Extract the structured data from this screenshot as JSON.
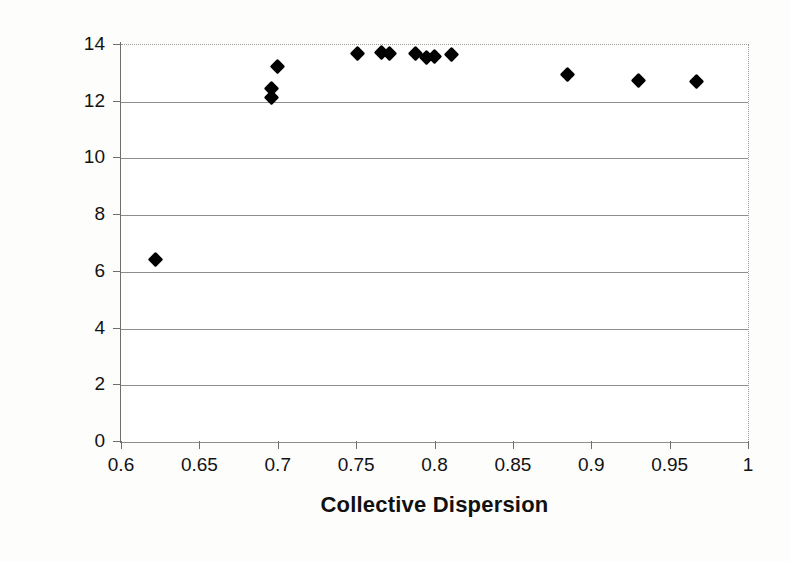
{
  "chart_data": {
    "type": "scatter",
    "title": "",
    "xlabel": "Collective Dispersion",
    "ylabel": "Collective Fitness",
    "xlim": [
      0.6,
      1.0
    ],
    "ylim": [
      0,
      14
    ],
    "xticks": [
      "0.6",
      "0.65",
      "0.7",
      "0.75",
      "0.8",
      "0.85",
      "0.9",
      "0.95",
      "1"
    ],
    "xtick_values": [
      0.6,
      0.65,
      0.7,
      0.75,
      0.8,
      0.85,
      0.9,
      0.95,
      1.0
    ],
    "yticks": [
      "0",
      "2",
      "4",
      "6",
      "8",
      "10",
      "12",
      "14"
    ],
    "ytick_values": [
      0,
      2,
      4,
      6,
      8,
      10,
      12,
      14
    ],
    "grid": "horizontal",
    "grid_color": "#8d8d8d",
    "legend": "none",
    "marker": "diamond",
    "marker_color": "#000000",
    "series": [
      {
        "name": "Collective Fitness",
        "points": [
          {
            "x": 0.622,
            "y": 6.45
          },
          {
            "x": 0.696,
            "y": 12.45
          },
          {
            "x": 0.696,
            "y": 12.15
          },
          {
            "x": 0.7,
            "y": 13.25
          },
          {
            "x": 0.751,
            "y": 13.7
          },
          {
            "x": 0.766,
            "y": 13.72
          },
          {
            "x": 0.771,
            "y": 13.7
          },
          {
            "x": 0.788,
            "y": 13.7
          },
          {
            "x": 0.795,
            "y": 13.55
          },
          {
            "x": 0.8,
            "y": 13.58
          },
          {
            "x": 0.811,
            "y": 13.65
          },
          {
            "x": 0.885,
            "y": 12.95
          },
          {
            "x": 0.93,
            "y": 12.75
          },
          {
            "x": 0.967,
            "y": 12.72
          }
        ]
      }
    ]
  }
}
